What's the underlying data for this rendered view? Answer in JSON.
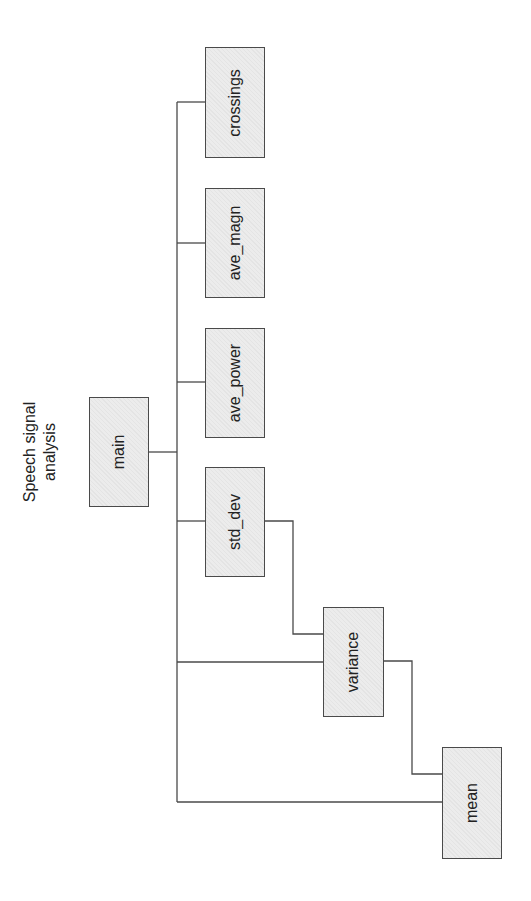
{
  "diagram": {
    "title_line1": "Speech signal",
    "title_line2": "analysis",
    "orientation": "rotated -90deg (tree grows left to right, drawn sideways)",
    "nodes": [
      {
        "id": "main",
        "label": "main"
      },
      {
        "id": "crossings",
        "label": "crossings"
      },
      {
        "id": "ave_magn",
        "label": "ave_magn"
      },
      {
        "id": "ave_power",
        "label": "ave_power"
      },
      {
        "id": "std_dev",
        "label": "std_dev"
      },
      {
        "id": "variance",
        "label": "variance"
      },
      {
        "id": "mean",
        "label": "mean"
      }
    ],
    "edges": [
      {
        "from": "main",
        "to": "crossings"
      },
      {
        "from": "main",
        "to": "ave_magn"
      },
      {
        "from": "main",
        "to": "ave_power"
      },
      {
        "from": "main",
        "to": "std_dev"
      },
      {
        "from": "main",
        "to": "variance"
      },
      {
        "from": "main",
        "to": "mean"
      },
      {
        "from": "std_dev",
        "to": "variance"
      },
      {
        "from": "variance",
        "to": "mean"
      }
    ],
    "colors": {
      "box_fill": "#ececec",
      "box_border": "#4a4a4a",
      "line": "#4a4a4a",
      "text": "#222222",
      "background": "#ffffff"
    }
  }
}
